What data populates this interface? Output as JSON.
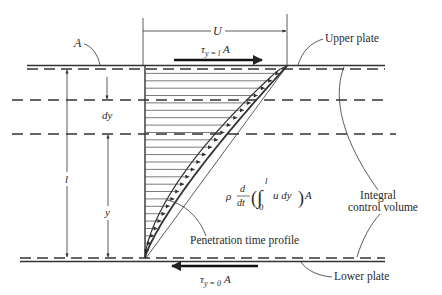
{
  "figure": {
    "type": "Couette flow transient velocity profile with integral control volume",
    "labels": {
      "area": "A",
      "velocity": "U",
      "upper_plate": "Upper plate",
      "lower_plate": "Lower plate",
      "dy": "dy",
      "height": "l",
      "y": "y",
      "penetration": "Penetration time profile",
      "control_volume_line1": "Integral",
      "control_volume_line2": "control volume"
    },
    "shear_top": {
      "symbol": "τ",
      "subscript": "y = l",
      "suffix": "A"
    },
    "shear_bottom": {
      "symbol": "τ",
      "subscript": "y = 0",
      "suffix": "A"
    },
    "equation": {
      "rho": "ρ",
      "d_num": "d",
      "d_den": "dt",
      "integral": "∫",
      "upper_limit": "l",
      "lower_limit": "0",
      "integrand": "u dy",
      "suffix": "A"
    },
    "colors": {
      "ink": "#2a2a2a",
      "background": "#ffffff"
    }
  }
}
